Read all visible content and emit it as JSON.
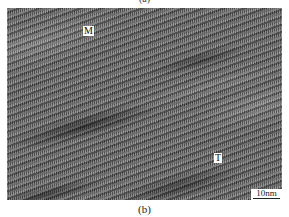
{
  "figure": {
    "caption_top": "(a)",
    "caption_bottom": "(b)",
    "micrograph": {
      "type": "HRTEM lattice image",
      "labels": [
        {
          "text": "M",
          "x": 83,
          "y": 31
        },
        {
          "text": "T",
          "x": 217,
          "y": 158
        }
      ],
      "scale_bar": {
        "label": "10nm"
      },
      "colors": {
        "base": "#6a6a6a",
        "label_bg": "#ffffff"
      }
    }
  }
}
